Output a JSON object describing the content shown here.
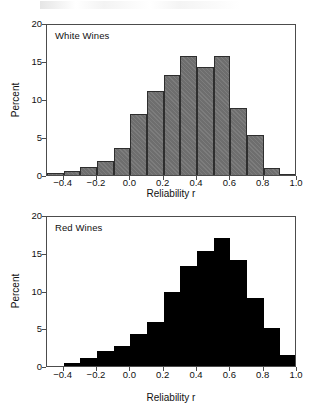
{
  "figure": {
    "background": "#ffffff",
    "axis_color": "#4c4c4c",
    "white_fill": "#6e6e6e",
    "red_fill": "#000000"
  },
  "panels": [
    {
      "key": "white",
      "label": "White Wines",
      "xlabel": "Reliability r",
      "ylabel": "Percent"
    },
    {
      "key": "red",
      "label": "Red Wines",
      "xlabel": "Reliability r",
      "ylabel": "Percent"
    }
  ],
  "axes": {
    "x_ticks": [
      "-0.4",
      "-0.2",
      "0.0",
      "0.2",
      "0.4",
      "0.6",
      "0.8",
      "1.0"
    ],
    "x_tick_values": [
      -0.4,
      -0.2,
      0.0,
      0.2,
      0.4,
      0.6,
      0.8,
      1.0
    ],
    "y_ticks": [
      "0",
      "5",
      "10",
      "15",
      "20"
    ],
    "y_tick_values": [
      0,
      5,
      10,
      15,
      20
    ],
    "xlim": [
      -0.5,
      1.0
    ],
    "ylim": [
      0,
      20
    ]
  },
  "chart_data": [
    {
      "type": "bar",
      "title": "White Wines",
      "xlabel": "Reliability r",
      "ylabel": "Percent",
      "xlim": [
        -0.5,
        1.0
      ],
      "ylim": [
        0,
        20
      ],
      "grid": false,
      "legend": "none",
      "bin_width": 0.1,
      "bin_edges": [
        -0.5,
        -0.4,
        -0.3,
        -0.2,
        -0.1,
        0.0,
        0.1,
        0.2,
        0.3,
        0.4,
        0.5,
        0.6,
        0.7,
        0.8,
        0.9,
        1.0
      ],
      "categories": [
        "-0.5 to -0.4",
        "-0.4 to -0.3",
        "-0.3 to -0.2",
        "-0.2 to -0.1",
        "-0.1 to 0.0",
        "0.0 to 0.1",
        "0.1 to 0.2",
        "0.2 to 0.3",
        "0.3 to 0.4",
        "0.4 to 0.5",
        "0.5 to 0.6",
        "0.6 to 0.7",
        "0.7 to 0.8",
        "0.8 to 0.9",
        "0.9 to 1.0"
      ],
      "values": [
        0.3,
        0.5,
        1.0,
        1.9,
        3.5,
        8.0,
        11.0,
        13.1,
        15.7,
        14.2,
        15.7,
        8.8,
        5.2,
        0.9,
        0.1
      ],
      "fill_color": "#6e6e6e",
      "edge_color": "#2e2e2e",
      "hatched": true
    },
    {
      "type": "bar",
      "title": "Red Wines",
      "xlabel": "Reliability r",
      "ylabel": "Percent",
      "xlim": [
        -0.5,
        1.0
      ],
      "ylim": [
        0,
        20
      ],
      "grid": false,
      "legend": "none",
      "bin_width": 0.1,
      "bin_edges": [
        -0.5,
        -0.4,
        -0.3,
        -0.2,
        -0.1,
        0.0,
        0.1,
        0.2,
        0.3,
        0.4,
        0.5,
        0.6,
        0.7,
        0.8,
        0.9,
        1.0
      ],
      "categories": [
        "-0.5 to -0.4",
        "-0.4 to -0.3",
        "-0.3 to -0.2",
        "-0.2 to -0.1",
        "-0.1 to 0.0",
        "0.0 to 0.1",
        "0.1 to 0.2",
        "0.2 to 0.3",
        "0.3 to 0.4",
        "0.4 to 0.5",
        "0.5 to 0.6",
        "0.6 to 0.7",
        "0.7 to 0.8",
        "0.8 to 0.9",
        "0.9 to 1.0"
      ],
      "values": [
        0.0,
        0.4,
        1.0,
        2.0,
        2.7,
        4.2,
        5.8,
        9.8,
        13.3,
        15.2,
        16.9,
        14.0,
        9.0,
        5.0,
        1.5
      ],
      "fill_color": "#000000",
      "edge_color": "#000000",
      "hatched": false
    }
  ]
}
